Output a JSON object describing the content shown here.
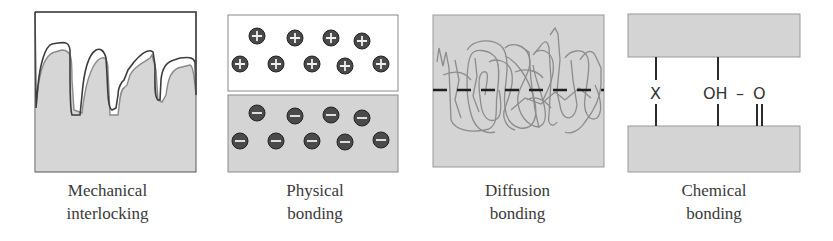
{
  "figure": {
    "panels": [
      {
        "id": "mechanical",
        "caption_line1": "Mechanical",
        "caption_line2": "interlocking"
      },
      {
        "id": "physical",
        "caption_line1": "Physical",
        "caption_line2": "bonding",
        "top_charge_symbol": "+",
        "bottom_charge_symbol": "−",
        "top_charge_count": 9,
        "bottom_charge_count": 9
      },
      {
        "id": "diffusion",
        "caption_line1": "Diffusion",
        "caption_line2": "bonding"
      },
      {
        "id": "chemical",
        "caption_line1": "Chemical",
        "caption_line2": "bonding",
        "bond_label_x": "X",
        "bond_label_oh": "OH",
        "bond_label_dash": "–",
        "bond_label_o": "O"
      }
    ]
  },
  "colors": {
    "substrate_fill": "#d4d4d4",
    "outline_dark": "#3c3c3c",
    "outline_gray": "#8a8a8a",
    "charge_fill": "#4a4a4a",
    "chain_stroke": "#8c8c8c",
    "caption_text": "#3a3a3a"
  }
}
